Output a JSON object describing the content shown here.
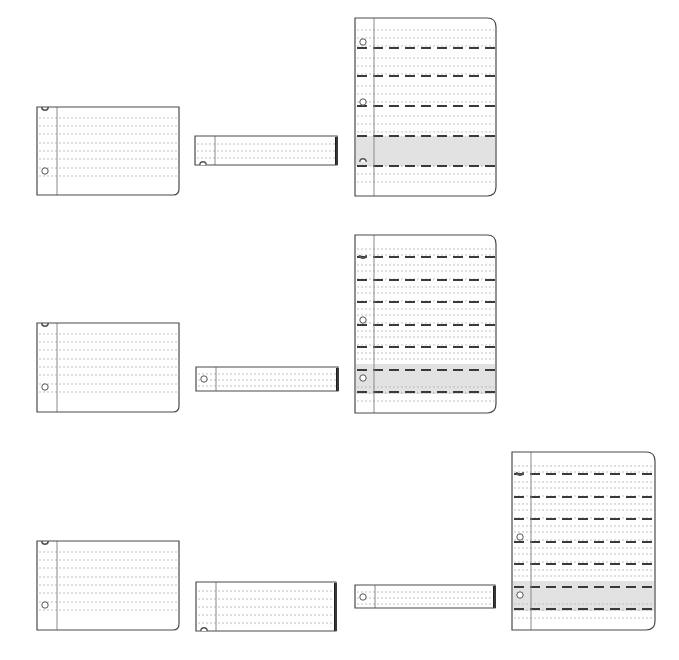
{
  "diagram": {
    "title": "",
    "colors": {
      "background": "#ffffff",
      "border": "#4a4a4a",
      "margin_line": "#8a8a8a",
      "dotted_line": "#b8b8b8",
      "dash_line": "#3a3a3a",
      "highlight_band": "#e2e2e2",
      "hole": "#555555"
    },
    "rows": [
      {
        "name": "row-1",
        "sheets": [
          {
            "kind": "landscape-card",
            "x": 37,
            "y": 107,
            "w": 142,
            "h": 88,
            "margin_x": 20,
            "lines": [
              11,
              19,
              27,
              36,
              44,
              52,
              61,
              69
            ],
            "holes": [
              {
                "y": 0,
                "half": "top"
              },
              {
                "y": 64,
                "half": "full"
              }
            ],
            "bands": [],
            "dashes": [],
            "corner": "br"
          },
          {
            "kind": "strip",
            "x": 195,
            "y": 136,
            "w": 142,
            "h": 29,
            "margin_x": 20,
            "lines": [
              8,
              15,
              22
            ],
            "holes": [
              {
                "y": 29,
                "half": "bottom-arc"
              }
            ],
            "bands": [],
            "dashes": [],
            "shadow_right": true
          },
          {
            "kind": "portrait-sheet",
            "x": 355,
            "y": 18,
            "w": 141,
            "h": 178,
            "margin_x": 19,
            "lines": [
              12,
              20,
              28,
              40,
              48,
              56,
              68,
              76,
              84,
              98,
              106,
              114,
              148,
              156,
              164
            ],
            "holes": [
              {
                "y": 24,
                "half": "full"
              },
              {
                "y": 84,
                "half": "full"
              },
              {
                "y": 144,
                "half": "bottom-arc"
              }
            ],
            "bands": [
              {
                "y": 118,
                "h": 30
              }
            ],
            "dashes": [
              30,
              58,
              88,
              118,
              148
            ],
            "corner": "tr-br"
          }
        ]
      },
      {
        "name": "row-2",
        "sheets": [
          {
            "kind": "landscape-card",
            "x": 37,
            "y": 323,
            "w": 142,
            "h": 89,
            "margin_x": 20,
            "lines": [
              11,
              19,
              27,
              36,
              44,
              52,
              61,
              69
            ],
            "holes": [
              {
                "y": 0,
                "half": "top"
              },
              {
                "y": 64,
                "half": "full"
              }
            ],
            "bands": [],
            "dashes": [],
            "corner": "br"
          },
          {
            "kind": "strip",
            "x": 196,
            "y": 367,
            "w": 142,
            "h": 24,
            "margin_x": 20,
            "lines": [
              7,
              13,
              19
            ],
            "holes": [
              {
                "y": 12,
                "half": "full"
              }
            ],
            "bands": [],
            "dashes": [],
            "shadow_right": true
          },
          {
            "kind": "portrait-sheet",
            "x": 355,
            "y": 235,
            "w": 141,
            "h": 178,
            "margin_x": 19,
            "lines": [
              14,
              20,
              30,
              36,
              44,
              52,
              58,
              66,
              74,
              80,
              88,
              96,
              102,
              110,
              118,
              124,
              152,
              158,
              166
            ],
            "holes": [
              {
                "y": 20,
                "half": "top"
              },
              {
                "y": 85,
                "half": "full"
              },
              {
                "y": 143,
                "half": "full"
              }
            ],
            "bands": [
              {
                "y": 129,
                "h": 30
              }
            ],
            "dashes": [
              22,
              45,
              67,
              90,
              112,
              135,
              157
            ],
            "corner": "tr-br"
          }
        ]
      },
      {
        "name": "row-3",
        "sheets": [
          {
            "kind": "landscape-card",
            "x": 37,
            "y": 541,
            "w": 142,
            "h": 89,
            "margin_x": 20,
            "lines": [
              11,
              19,
              27,
              36,
              44,
              52,
              61,
              69
            ],
            "holes": [
              {
                "y": 0,
                "half": "top"
              },
              {
                "y": 64,
                "half": "full"
              }
            ],
            "bands": [],
            "dashes": [],
            "corner": "br"
          },
          {
            "kind": "strip",
            "x": 196,
            "y": 582,
            "w": 140,
            "h": 49,
            "margin_x": 20,
            "lines": [
              9,
              17,
              25,
              33,
              41
            ],
            "holes": [
              {
                "y": 49,
                "half": "bottom-arc"
              }
            ],
            "bands": [],
            "dashes": [],
            "shadow_right": true
          },
          {
            "kind": "strip",
            "x": 355,
            "y": 585,
            "w": 140,
            "h": 23,
            "margin_x": 20,
            "lines": [
              7,
              13,
              19
            ],
            "holes": [
              {
                "y": 12,
                "half": "full"
              }
            ],
            "bands": [],
            "dashes": [],
            "shadow_right": true
          },
          {
            "kind": "portrait-sheet",
            "x": 512,
            "y": 452,
            "w": 143,
            "h": 178,
            "margin_x": 19,
            "lines": [
              14,
              20,
              30,
              36,
              44,
              52,
              58,
              66,
              74,
              80,
              88,
              96,
              102,
              110,
              118,
              124,
              152,
              158,
              166
            ],
            "holes": [
              {
                "y": 20,
                "half": "top"
              },
              {
                "y": 85,
                "half": "full"
              },
              {
                "y": 143,
                "half": "full"
              }
            ],
            "bands": [
              {
                "y": 129,
                "h": 30
              }
            ],
            "dashes": [
              22,
              45,
              67,
              90,
              112,
              135,
              157
            ],
            "corner": "tr-br"
          }
        ]
      }
    ]
  }
}
